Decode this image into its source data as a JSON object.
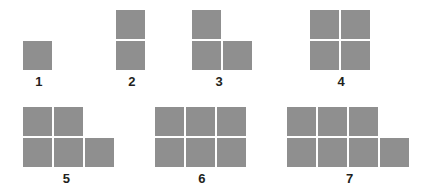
{
  "diagram": {
    "background_color": "#ffffff",
    "square_color": "#8f8f8f",
    "label_color": "#231f20",
    "figures": [
      {
        "label": "1",
        "count": 1,
        "left": 23,
        "label_center": 39,
        "rows": [
          [
            1
          ]
        ]
      },
      {
        "label": "2",
        "count": 2,
        "left": 116,
        "label_center": 132,
        "rows": [
          [
            1
          ],
          [
            1
          ]
        ]
      },
      {
        "label": "3",
        "count": 3,
        "left": 192,
        "label_center": 215,
        "rows": [
          [
            1,
            0
          ],
          [
            1,
            1
          ]
        ]
      },
      {
        "label": "4",
        "count": 4,
        "left": 310,
        "label_center": 341,
        "rows": [
          [
            1,
            1
          ],
          [
            1,
            1
          ]
        ]
      },
      {
        "label": "5",
        "count": 5,
        "left": 23,
        "label_center": 63,
        "rows": [
          [
            1,
            1,
            0
          ],
          [
            1,
            1,
            1
          ]
        ]
      },
      {
        "label": "6",
        "count": 6,
        "left": 155,
        "label_center": 202,
        "rows": [
          [
            1,
            1,
            1
          ],
          [
            1,
            1,
            1
          ]
        ]
      },
      {
        "label": "7",
        "count": 7,
        "left": 287,
        "label_center": 350,
        "rows": [
          [
            1,
            1,
            1,
            0
          ],
          [
            1,
            1,
            1,
            1
          ]
        ]
      }
    ],
    "rows_layout": [
      {
        "name": "top-row",
        "figure_indices": [
          0,
          1,
          2,
          3
        ],
        "shape_bottom": 70,
        "label_top": 71
      },
      {
        "name": "bottom-row",
        "figure_indices": [
          4,
          5,
          6
        ],
        "shape_bottom": 167,
        "label_top": 168
      }
    ]
  }
}
